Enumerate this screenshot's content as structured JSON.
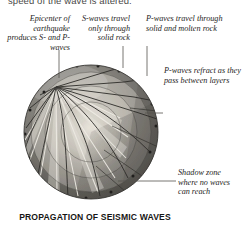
{
  "figure": {
    "caption": "PROPAGATION OF SEISMIC WAVES",
    "running_text": "speed of the wave is altered."
  },
  "labels": {
    "epicenter": "Epicenter of earthquake produces S- and P-waves",
    "s_waves": "S-waves travel only through solid rock",
    "p_waves": "P-waves travel through solid and molten rock",
    "refraction": "P-waves refract as they pass between layers",
    "shadow_zone": "Shadow zone where no waves can reach"
  },
  "colors": {
    "ink": "#262523",
    "caption": "#161514",
    "leader": "#4d4c4a",
    "ray_dark": "#2b2a28",
    "ray_light": "#f2f0ea",
    "crust": "#6f6d68",
    "mantle_outer": "#9a9790",
    "mantle_inner": "#b9b5ad",
    "outer_core": "#c9c5bd",
    "inner_core": "#d8d4cc",
    "shadow": "#55534f"
  },
  "diagram": {
    "type": "cross-section",
    "sphere": {
      "cx": 91,
      "cy": 132,
      "r": 67
    },
    "epicenter": {
      "x": 56,
      "y": 87
    },
    "layers": [
      {
        "name": "crust",
        "radius": 67
      },
      {
        "name": "upper-mantle",
        "radius": 60
      },
      {
        "name": "lower-mantle",
        "radius": 46
      },
      {
        "name": "outer-core",
        "radius": 30
      },
      {
        "name": "inner-core",
        "radius": 14
      }
    ],
    "ray_count": 26
  }
}
